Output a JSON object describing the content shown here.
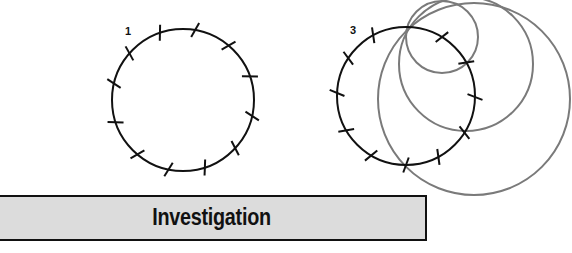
{
  "banner": {
    "title": "Investigation"
  },
  "colors": {
    "black_circle": "#111111",
    "gray_circle": "#7a7a7a",
    "banner_bg": "#dcdcdc",
    "banner_border": "#111111"
  },
  "figures": [
    {
      "label": "1",
      "circle": {
        "cx": 183,
        "cy": 100,
        "r": 71
      },
      "ticks": [
        [
          160,
          33
        ],
        [
          195,
          31
        ],
        [
          229,
          45
        ],
        [
          248,
          77
        ],
        [
          252,
          116
        ],
        [
          235,
          148
        ],
        [
          205,
          168
        ],
        [
          168,
          172
        ],
        [
          137,
          155
        ],
        [
          116,
          122
        ],
        [
          112,
          83
        ],
        [
          129,
          53
        ]
      ]
    },
    {
      "label": "3",
      "circle": {
        "cx": 406,
        "cy": 96,
        "r": 69
      },
      "ticks": [
        [
          373,
          35
        ],
        [
          348,
          58
        ],
        [
          338,
          93
        ],
        [
          347,
          130
        ],
        [
          372,
          154
        ],
        [
          406,
          163
        ],
        [
          440,
          160
        ],
        [
          465,
          133
        ],
        [
          473,
          97
        ],
        [
          467,
          62
        ],
        [
          442,
          37
        ]
      ],
      "gray_circles": [
        {
          "cx": 442,
          "cy": 37,
          "r": 36
        },
        {
          "cx": 466,
          "cy": 64,
          "r": 67
        },
        {
          "cx": 474,
          "cy": 99,
          "r": 96
        }
      ]
    }
  ]
}
